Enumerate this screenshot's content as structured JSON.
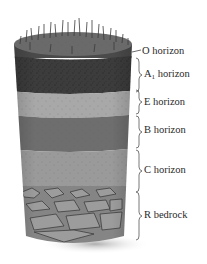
{
  "diagram": {
    "type": "soil-horizon-cross-section",
    "colors": {
      "background": "#ffffff",
      "o_horizon": "#4a4a4a",
      "a1_horizon": "#3c3c3c",
      "e_horizon": "#a8a8a8",
      "b_horizon": "#6e6e6e",
      "c_horizon": "#9a9a9a",
      "r_bedrock": "#858585",
      "label_text": "#2a2a2a",
      "brace": "#555555"
    },
    "horizons": [
      {
        "id": "O",
        "name": "O horizon",
        "prefix": "O",
        "subscript": "",
        "suffix": " horizon",
        "y_top": 48,
        "y_bottom": 56
      },
      {
        "id": "A1",
        "name": "A1 horizon",
        "prefix": "A",
        "subscript": "1",
        "suffix": " horizon",
        "y_top": 58,
        "y_bottom": 88
      },
      {
        "id": "E",
        "name": "E horizon",
        "prefix": "E",
        "subscript": "",
        "suffix": " horizon",
        "y_top": 88,
        "y_bottom": 114
      },
      {
        "id": "B",
        "name": "B horizon",
        "prefix": "B",
        "subscript": "",
        "suffix": " horizon",
        "y_top": 114,
        "y_bottom": 148
      },
      {
        "id": "C",
        "name": "C horizon",
        "prefix": "C",
        "subscript": "",
        "suffix": " horizon",
        "y_top": 148,
        "y_bottom": 190
      },
      {
        "id": "R",
        "name": "R bedrock",
        "prefix": "R",
        "subscript": "",
        "suffix": " bedrock",
        "y_top": 190,
        "y_bottom": 237
      }
    ]
  }
}
